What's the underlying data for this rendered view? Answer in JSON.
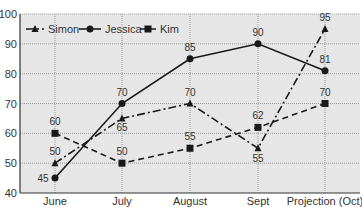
{
  "chart_data": {
    "type": "line",
    "title": "",
    "xlabel": "",
    "ylabel": "",
    "categories": [
      "June",
      "July",
      "August",
      "Sept",
      "Projection (Oct)"
    ],
    "ylim": [
      40,
      100
    ],
    "yticks": [
      40,
      50,
      60,
      70,
      80,
      90,
      100
    ],
    "grid": true,
    "legend_position": "top-left inside",
    "series": [
      {
        "name": "Simon",
        "style": "dash-dot",
        "marker": "triangle",
        "values": [
          50,
          65,
          70,
          55,
          95
        ]
      },
      {
        "name": "Jessica",
        "style": "solid",
        "marker": "circle",
        "values": [
          45,
          70,
          85,
          90,
          81
        ]
      },
      {
        "name": "Kim",
        "style": "dashed",
        "marker": "square",
        "values": [
          60,
          50,
          55,
          62,
          70
        ]
      }
    ]
  },
  "colors": {
    "plot_background": "#e6e6e6",
    "line": "#1a1a1a",
    "grid": "#9a9a9a",
    "text": "#333333"
  }
}
